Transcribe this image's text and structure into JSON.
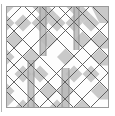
{
  "figure": {
    "type": "diagram",
    "canvas": {
      "width": 115,
      "height": 116,
      "background": "#ffffff"
    }
  },
  "colors": {
    "background": "#ffffff",
    "panel_fill": "#fdfdfd",
    "cell_light": "#ffffff",
    "cell_gray": "#c9c9c9",
    "cell_gray_dark": "#b9b9b9",
    "cell_gray_light": "#dedede",
    "stroke_dark": "#555555",
    "stroke_mid": "#8c8c8c",
    "stroke_light": "#b0b0b0",
    "frame_stroke": "#9a9a9a",
    "margin_rule": "#b5b5b5"
  },
  "panel": {
    "x": 6,
    "y": 6,
    "width": 103,
    "height": 102,
    "stroke_width": 1
  },
  "margin_rule": {
    "x": 1.5,
    "y_top": 4,
    "y_bottom": 112,
    "stroke_width": 1
  },
  "lattice": {
    "description": "45-degree diagonal grid forming diamonds, spacing 17px, plus vertical strip boundaries",
    "diagonal_spacing": 17,
    "diagonal_angle_deg": 45,
    "vertical_lines": [
      6,
      23,
      40,
      57,
      74,
      91,
      109
    ],
    "horizontal_lines": [
      6,
      108
    ]
  },
  "vertical_strips": [
    {
      "name": "strip-a",
      "x": 40,
      "width": 6,
      "y": 6,
      "height": 50,
      "fill": "#b9b9b9"
    },
    {
      "name": "strip-b",
      "x": 74,
      "width": 5,
      "y": 6,
      "height": 44,
      "fill": "#b9b9b9"
    },
    {
      "name": "strip-c",
      "x": 28,
      "width": 6,
      "y": 60,
      "height": 48,
      "fill": "#b9b9b9"
    },
    {
      "name": "strip-d",
      "x": 62,
      "width": 7,
      "y": 68,
      "height": 40,
      "fill": "#b9b9b9"
    }
  ],
  "gray_cells": {
    "count": 34,
    "description": "Alternating shaded diamonds and triangles of the lattice"
  },
  "legend": {
    "visible": false
  },
  "labels": {
    "visible": false,
    "items": []
  }
}
